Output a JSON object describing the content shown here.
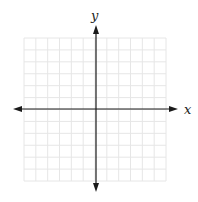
{
  "chart_data": {
    "type": "coordinate-plane",
    "title": "",
    "xlabel": "x",
    "ylabel": "y",
    "grid": true,
    "grid_cells_x": 12,
    "grid_cells_y": 12,
    "xlim": [
      -6,
      6
    ],
    "ylim": [
      -6,
      6
    ],
    "tick_labels": [],
    "arrows": [
      "left",
      "right",
      "up",
      "down"
    ]
  },
  "colors": {
    "grid": "#e6e6e6",
    "axis": "#1a1a1a",
    "background": "#ffffff"
  }
}
